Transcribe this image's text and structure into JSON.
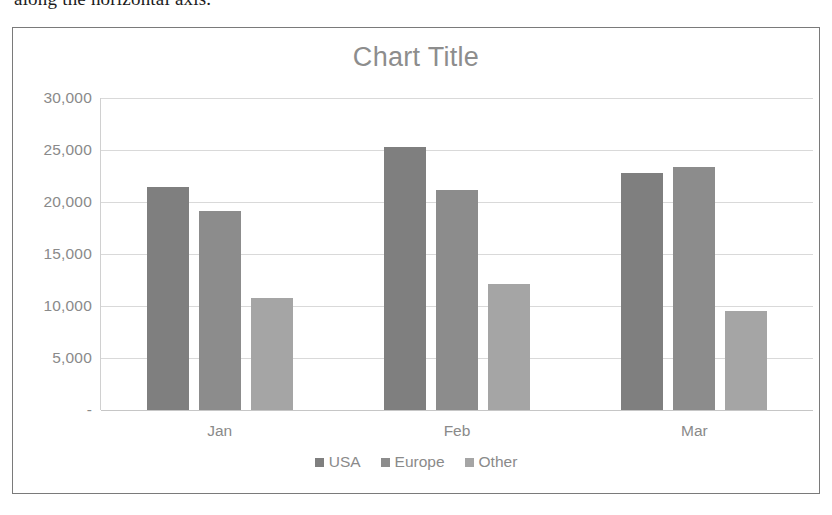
{
  "page": {
    "text_fragment": "along the horizontal axis."
  },
  "chart_data": {
    "type": "bar",
    "title": "Chart Title",
    "xlabel": "",
    "ylabel": "",
    "categories": [
      "Jan",
      "Feb",
      "Mar"
    ],
    "series": [
      {
        "name": "USA",
        "color": "#7f7f7f",
        "values": [
          21400,
          25300,
          22800
        ]
      },
      {
        "name": "Europe",
        "color": "#8c8c8c",
        "values": [
          19100,
          21200,
          23400
        ]
      },
      {
        "name": "Other",
        "color": "#a5a5a5",
        "values": [
          10800,
          12100,
          9500
        ]
      }
    ],
    "ylim": [
      0,
      30000
    ],
    "ytick_values": [
      30000,
      25000,
      20000,
      15000,
      10000,
      5000,
      0
    ],
    "ytick_labels": [
      "30,000",
      "25,000",
      "20,000",
      "15,000",
      "10,000",
      " 5,000",
      "-"
    ],
    "grid": true,
    "legend_position": "bottom",
    "title_color": "#8d8d8d",
    "label_color": "#8a8a8a",
    "gridline_color": "#d9d9d9",
    "plot_background": "#ffffff",
    "border_color": "#7a7a7a"
  }
}
